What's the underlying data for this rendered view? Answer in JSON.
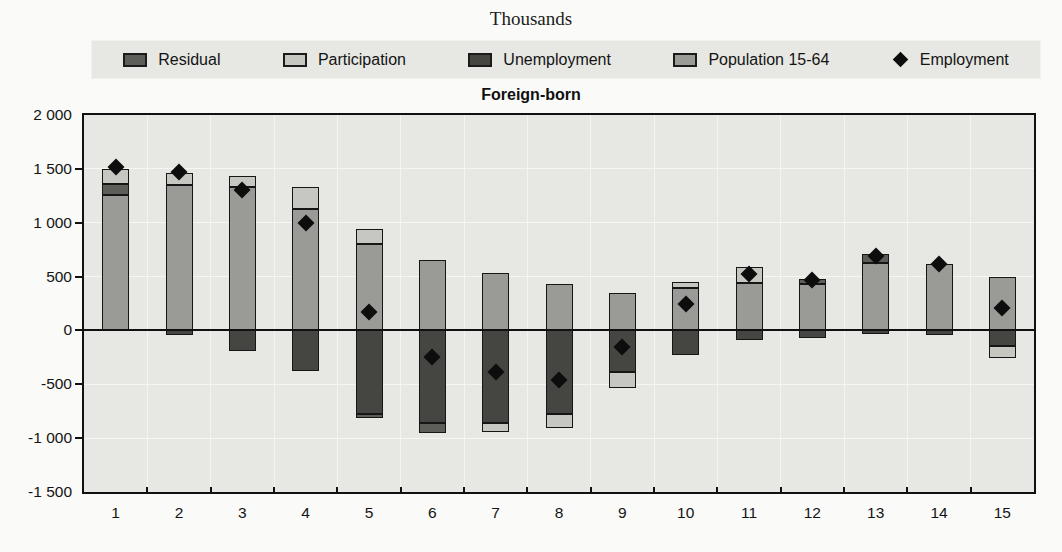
{
  "page": {
    "top_label": "Thousands",
    "chart_title": "Foreign-born"
  },
  "chart_data": {
    "type": "bar",
    "stacked": true,
    "title": "Foreign-born",
    "units_label": "Thousands",
    "xlabel": "",
    "ylabel": "Thousands",
    "grid": true,
    "legend_position": "top",
    "ylim": [
      -1500,
      2000
    ],
    "yticks": [
      {
        "value": 2000,
        "label": "2 000"
      },
      {
        "value": 1500,
        "label": "1 500"
      },
      {
        "value": 1000,
        "label": "1 000"
      },
      {
        "value": 500,
        "label": "500"
      },
      {
        "value": 0,
        "label": "0"
      },
      {
        "value": -500,
        "label": "-500"
      },
      {
        "value": -1000,
        "label": "-1 000"
      },
      {
        "value": -1500,
        "label": "-1 500"
      }
    ],
    "categories": [
      "1",
      "2",
      "3",
      "4",
      "5",
      "6",
      "7",
      "8",
      "9",
      "10",
      "11",
      "12",
      "13",
      "14",
      "15"
    ],
    "legend": [
      {
        "label": "Residual",
        "swatch": "box",
        "color_key": "residual"
      },
      {
        "label": "Participation",
        "swatch": "box",
        "color_key": "participation"
      },
      {
        "label": "Unemployment",
        "swatch": "box",
        "color_key": "unemployment"
      },
      {
        "label": "Population 15-64",
        "swatch": "box",
        "color_key": "population"
      },
      {
        "label": "Employment",
        "swatch": "diamond",
        "color_key": "employment"
      }
    ],
    "colors": {
      "population": "#9a9a96",
      "participation": "#c7c7c2",
      "unemployment": "#454541",
      "residual": "#5d5d59",
      "employment": "#0d0d0d",
      "plot_background": "#e7e7e3",
      "gridline": "#f6f6f3",
      "axis": "#111111"
    },
    "bars": [
      {
        "category": "1",
        "employment": 1520,
        "segments": [
          {
            "component": "population",
            "from": 0,
            "to": 1255
          },
          {
            "component": "residual",
            "from": 1255,
            "to": 1360
          },
          {
            "component": "participation",
            "from": 1360,
            "to": 1495
          }
        ]
      },
      {
        "category": "2",
        "employment": 1475,
        "segments": [
          {
            "component": "unemployment",
            "from": -40,
            "to": 0
          },
          {
            "component": "population",
            "from": 0,
            "to": 1350
          },
          {
            "component": "participation",
            "from": 1350,
            "to": 1460
          }
        ]
      },
      {
        "category": "3",
        "employment": 1300,
        "segments": [
          {
            "component": "unemployment",
            "from": -190,
            "to": 0
          },
          {
            "component": "population",
            "from": 0,
            "to": 1330
          },
          {
            "component": "participation",
            "from": 1330,
            "to": 1430
          }
        ]
      },
      {
        "category": "4",
        "employment": 1000,
        "segments": [
          {
            "component": "unemployment",
            "from": -380,
            "to": 0
          },
          {
            "component": "population",
            "from": 0,
            "to": 1130
          },
          {
            "component": "participation",
            "from": 1130,
            "to": 1330
          }
        ]
      },
      {
        "category": "5",
        "employment": 175,
        "segments": [
          {
            "component": "residual",
            "from": -815,
            "to": -780
          },
          {
            "component": "unemployment",
            "from": -780,
            "to": 0
          },
          {
            "component": "population",
            "from": 0,
            "to": 800
          },
          {
            "component": "participation",
            "from": 800,
            "to": 945
          }
        ]
      },
      {
        "category": "6",
        "employment": -250,
        "segments": [
          {
            "component": "residual",
            "from": -950,
            "to": -860
          },
          {
            "component": "unemployment",
            "from": -860,
            "to": 0
          },
          {
            "component": "population",
            "from": 0,
            "to": 650
          }
        ]
      },
      {
        "category": "7",
        "employment": -390,
        "segments": [
          {
            "component": "participation",
            "from": -940,
            "to": -860
          },
          {
            "component": "unemployment",
            "from": -860,
            "to": 0
          },
          {
            "component": "population",
            "from": 0,
            "to": 530
          }
        ]
      },
      {
        "category": "8",
        "employment": -460,
        "segments": [
          {
            "component": "participation",
            "from": -905,
            "to": -780
          },
          {
            "component": "unemployment",
            "from": -780,
            "to": 0
          },
          {
            "component": "population",
            "from": 0,
            "to": 430
          }
        ]
      },
      {
        "category": "9",
        "employment": -150,
        "segments": [
          {
            "component": "participation",
            "from": -530,
            "to": -390
          },
          {
            "component": "unemployment",
            "from": -390,
            "to": 0
          },
          {
            "component": "population",
            "from": 0,
            "to": 350
          }
        ]
      },
      {
        "category": "10",
        "employment": 250,
        "segments": [
          {
            "component": "unemployment",
            "from": -230,
            "to": 0
          },
          {
            "component": "population",
            "from": 0,
            "to": 390
          },
          {
            "component": "participation",
            "from": 390,
            "to": 450
          }
        ]
      },
      {
        "category": "11",
        "employment": 520,
        "segments": [
          {
            "component": "unemployment",
            "from": -90,
            "to": 0
          },
          {
            "component": "population",
            "from": 0,
            "to": 440
          },
          {
            "component": "participation",
            "from": 440,
            "to": 590
          }
        ]
      },
      {
        "category": "12",
        "employment": 470,
        "segments": [
          {
            "component": "unemployment",
            "from": -70,
            "to": 0
          },
          {
            "component": "population",
            "from": 0,
            "to": 430
          },
          {
            "component": "residual",
            "from": 430,
            "to": 480
          }
        ]
      },
      {
        "category": "13",
        "employment": 695,
        "segments": [
          {
            "component": "unemployment",
            "from": -30,
            "to": 0
          },
          {
            "component": "population",
            "from": 0,
            "to": 625
          },
          {
            "component": "residual",
            "from": 625,
            "to": 710
          }
        ]
      },
      {
        "category": "14",
        "employment": 615,
        "segments": [
          {
            "component": "unemployment",
            "from": -40,
            "to": 0
          },
          {
            "component": "population",
            "from": 0,
            "to": 615
          }
        ]
      },
      {
        "category": "15",
        "employment": 210,
        "segments": [
          {
            "component": "participation",
            "from": -260,
            "to": -145
          },
          {
            "component": "unemployment",
            "from": -145,
            "to": 0
          },
          {
            "component": "population",
            "from": 0,
            "to": 500
          }
        ]
      }
    ]
  }
}
